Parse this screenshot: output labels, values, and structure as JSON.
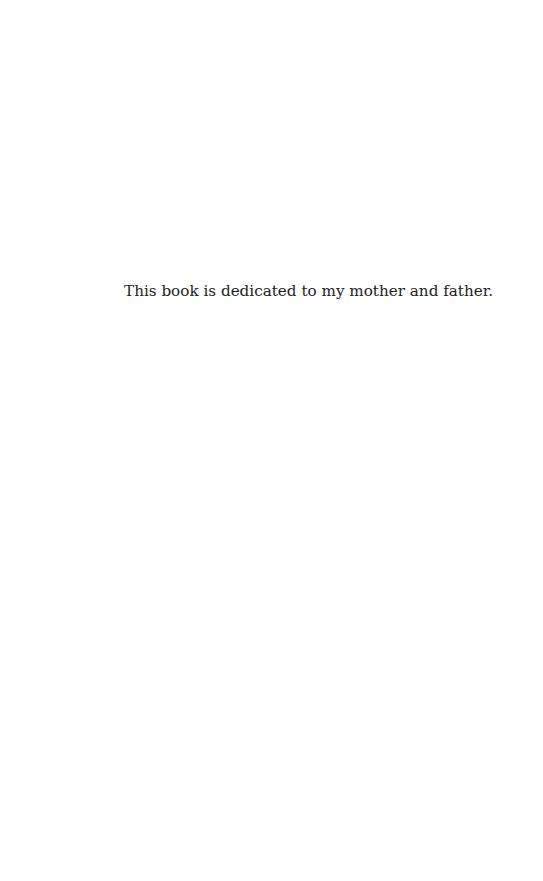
{
  "page": {
    "dedication_text": "This book is dedicated to my mother and father."
  }
}
